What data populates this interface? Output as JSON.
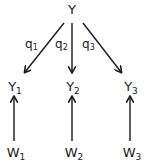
{
  "diagram": {
    "root": {
      "base": "Y",
      "sub": ""
    },
    "middle_nodes": [
      {
        "base": "Y",
        "sub": "1"
      },
      {
        "base": "Y",
        "sub": "2"
      },
      {
        "base": "Y",
        "sub": "3"
      }
    ],
    "bottom_nodes": [
      {
        "base": "W",
        "sub": "1"
      },
      {
        "base": "W",
        "sub": "2"
      },
      {
        "base": "W",
        "sub": "3"
      }
    ],
    "edge_labels": [
      {
        "base": "q",
        "sub": "1"
      },
      {
        "base": "q",
        "sub": "2"
      },
      {
        "base": "q",
        "sub": "3"
      }
    ],
    "edges": [
      {
        "from": "Y",
        "to": "Y1",
        "label": "q1"
      },
      {
        "from": "Y",
        "to": "Y2",
        "label": "q2"
      },
      {
        "from": "Y",
        "to": "Y3",
        "label": "q3"
      },
      {
        "from": "W1",
        "to": "Y1"
      },
      {
        "from": "W2",
        "to": "Y2"
      },
      {
        "from": "W3",
        "to": "Y3"
      }
    ],
    "colors": {
      "stroke": "#1a1a1a",
      "background": "#ffffff"
    }
  }
}
